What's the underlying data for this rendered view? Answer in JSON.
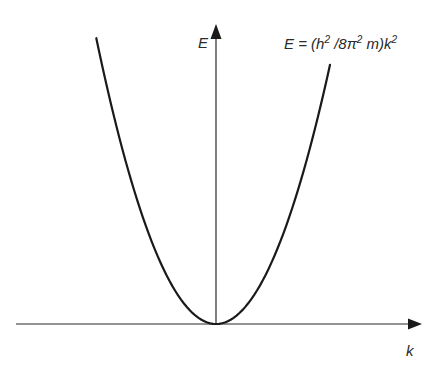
{
  "chart_data": {
    "type": "line",
    "title": "",
    "xlabel": "k",
    "ylabel": "E",
    "annotation": {
      "text_parts": [
        "E = (h",
        "2",
        " /8π",
        "2",
        " m)k",
        "2"
      ],
      "plain": "E = (h^2/8π^2 m)k^2"
    },
    "function": "parabola",
    "equation": "E = (h^2/8π^2 m) k^2",
    "xlim": [
      -1,
      1
    ],
    "ylim": [
      0,
      1
    ],
    "series": [
      {
        "name": "free-electron dispersion",
        "k_range": [
          -0.63,
          0.6
        ],
        "coefficient": 2.4,
        "samples": 80
      }
    ],
    "grid": false,
    "ticks": false,
    "colors": {
      "axis": "#2a2a2a",
      "curve": "#1a1a1a",
      "background": "#ffffff"
    }
  }
}
